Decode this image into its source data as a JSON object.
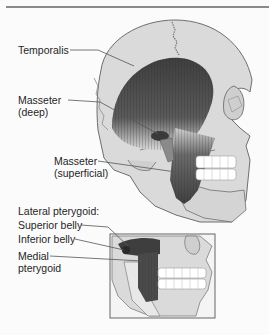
{
  "figure": {
    "upper_panel": {
      "labels": {
        "temporalis": "Temporalis",
        "masseter_deep_line1": "Masseter",
        "masseter_deep_line2": "(deep)",
        "masseter_superficial_line1": "Masseter",
        "masseter_superficial_line2": "(superficial)"
      }
    },
    "lower_panel": {
      "labels": {
        "lateral_pterygoid": "Lateral pterygoid:",
        "superior_belly": "Superior belly",
        "inferior_belly": "Inferior belly",
        "medial_pterygoid_line1": "Medial",
        "medial_pterygoid_line2": "pterygoid"
      }
    },
    "colors": {
      "background": "#fbfbfb",
      "skull": "#d9d9d9",
      "skull_outline": "#6e6e6e",
      "muscle_dark": "#4a4a4a",
      "muscle_mid": "#7a7a7a",
      "teeth": "#ffffff",
      "leader_line": "#555555",
      "rule": "#8a8a8a"
    }
  }
}
